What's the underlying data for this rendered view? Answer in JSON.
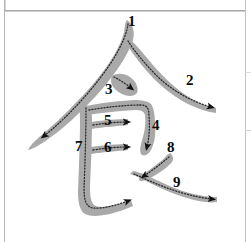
{
  "diagram": {
    "character": "食",
    "type": "stroke-order-diagram",
    "stroke_count": 9,
    "background_color": "#ffffff",
    "stroke_fill_color": "#a9a9a9",
    "guide_path_color": "#2b2b2b",
    "arrow_color": "#111111",
    "number_color": "#0b0b0b",
    "frame_color": "#b9b9b9"
  },
  "frame": {
    "top_rule": "horizontal-rule",
    "left_rule": "vertical-rule",
    "right_rule": "vertical-rule",
    "right_tick_1": "tick",
    "right_tick_2": "tick"
  },
  "strokes": [
    {
      "number": "1",
      "name": "left-falling-diagonal",
      "label_x": 128,
      "label_y": 14
    },
    {
      "number": "2",
      "name": "right-falling-diagonal",
      "label_x": 186,
      "label_y": 73
    },
    {
      "number": "3",
      "name": "short-right-falling-dot",
      "label_x": 105,
      "label_y": 82
    },
    {
      "number": "4",
      "name": "horizontal-turn-vertical",
      "label_x": 152,
      "label_y": 118
    },
    {
      "number": "5",
      "name": "upper-horizontal",
      "label_x": 104,
      "label_y": 113
    },
    {
      "number": "6",
      "name": "lower-horizontal",
      "label_x": 104,
      "label_y": 140
    },
    {
      "number": "7",
      "name": "vertical-turn-horizontal",
      "label_x": 75,
      "label_y": 139
    },
    {
      "number": "8",
      "name": "short-left-falling",
      "label_x": 167,
      "label_y": 140
    },
    {
      "number": "9",
      "name": "long-right-falling",
      "label_x": 173,
      "label_y": 175
    }
  ]
}
